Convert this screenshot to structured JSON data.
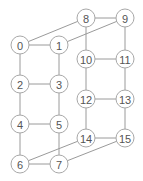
{
  "diagram": {
    "nodes": [
      {
        "id": "0",
        "label": "0",
        "x": 20,
        "y": 45
      },
      {
        "id": "1",
        "label": "1",
        "x": 59,
        "y": 45
      },
      {
        "id": "2",
        "label": "2",
        "x": 20,
        "y": 84
      },
      {
        "id": "3",
        "label": "3",
        "x": 59,
        "y": 84
      },
      {
        "id": "4",
        "label": "4",
        "x": 20,
        "y": 124
      },
      {
        "id": "5",
        "label": "5",
        "x": 59,
        "y": 124
      },
      {
        "id": "6",
        "label": "6",
        "x": 20,
        "y": 164
      },
      {
        "id": "7",
        "label": "7",
        "x": 59,
        "y": 164
      },
      {
        "id": "8",
        "label": "8",
        "x": 86,
        "y": 18
      },
      {
        "id": "9",
        "label": "9",
        "x": 125,
        "y": 18
      },
      {
        "id": "10",
        "label": "10",
        "x": 86,
        "y": 59
      },
      {
        "id": "11",
        "label": "11",
        "x": 125,
        "y": 59
      },
      {
        "id": "12",
        "label": "12",
        "x": 86,
        "y": 99
      },
      {
        "id": "13",
        "label": "13",
        "x": 125,
        "y": 99
      },
      {
        "id": "14",
        "label": "14",
        "x": 86,
        "y": 138
      },
      {
        "id": "15",
        "label": "15",
        "x": 125,
        "y": 138
      }
    ],
    "edges": [
      [
        "0",
        "1"
      ],
      [
        "0",
        "2"
      ],
      [
        "1",
        "3"
      ],
      [
        "2",
        "3"
      ],
      [
        "2",
        "4"
      ],
      [
        "3",
        "5"
      ],
      [
        "4",
        "5"
      ],
      [
        "4",
        "6"
      ],
      [
        "5",
        "7"
      ],
      [
        "6",
        "7"
      ],
      [
        "8",
        "9"
      ],
      [
        "8",
        "10"
      ],
      [
        "9",
        "11"
      ],
      [
        "10",
        "11"
      ],
      [
        "10",
        "12"
      ],
      [
        "11",
        "13"
      ],
      [
        "12",
        "13"
      ],
      [
        "12",
        "14"
      ],
      [
        "13",
        "15"
      ],
      [
        "14",
        "15"
      ],
      [
        "0",
        "8"
      ],
      [
        "1",
        "9"
      ],
      [
        "6",
        "14"
      ],
      [
        "7",
        "15"
      ]
    ],
    "node_radius": 9,
    "colors": {
      "node_stroke": "#a8a8a8",
      "edge": "#9a9a9a",
      "label": "#555555",
      "background": "#ffffff"
    }
  }
}
